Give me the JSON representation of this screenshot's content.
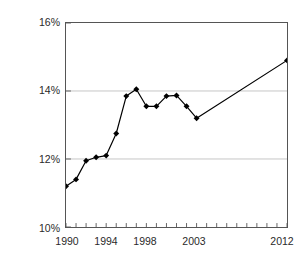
{
  "chart_data": {
    "type": "line",
    "title": "",
    "subtitle": "",
    "xlabel": "",
    "ylabel": "(CA Jobs as % U.S.)",
    "ylim": [
      10,
      16
    ],
    "xlim": [
      1990,
      2012
    ],
    "grid": "horizontal",
    "legend": "none",
    "marker": "diamond",
    "y_tick_labels": [
      "16%",
      "14%",
      "12%",
      "10%"
    ],
    "y_tick_values": [
      16,
      14,
      12,
      10
    ],
    "x_tick_labels": [
      "1990",
      "1994",
      "1998",
      "2003",
      "2012"
    ],
    "x_tick_values": [
      1990,
      1994,
      1998,
      2003,
      2012
    ],
    "x_minor_ticks": [
      1990,
      1991,
      1992,
      1993,
      1994,
      1995,
      1996,
      1997,
      1998,
      1999,
      2000,
      2001,
      2002,
      2003,
      2004,
      2005,
      2006,
      2007,
      2008,
      2009,
      2010,
      2011,
      2012
    ],
    "series": [
      {
        "name": "CA Jobs as % U.S.",
        "x": [
          1990,
          1991,
          1992,
          1993,
          1994,
          1995,
          1996,
          1997,
          1998,
          1999,
          2000,
          2001,
          2002,
          2003,
          2012
        ],
        "values": [
          11.2,
          11.4,
          11.95,
          12.05,
          12.1,
          12.75,
          13.85,
          14.05,
          13.55,
          13.55,
          13.85,
          13.87,
          13.55,
          13.2,
          14.9
        ],
        "color": "#000000"
      }
    ],
    "colors": {
      "line": "#000000",
      "marker": "#000000",
      "axis": "#555555",
      "gridline": "#bfbfbf",
      "text": "#2a2a2a",
      "background": "#ffffff"
    }
  }
}
